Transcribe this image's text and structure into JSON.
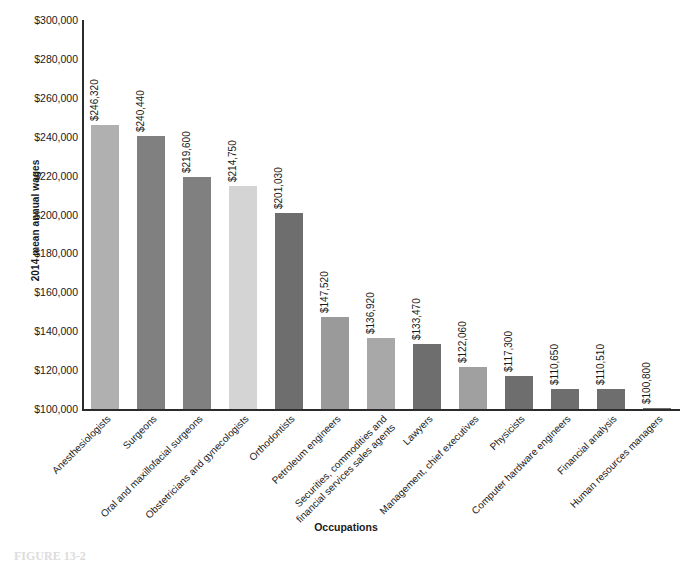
{
  "chart_data": {
    "type": "bar",
    "title": "",
    "xlabel": "Occupations",
    "ylabel": "2014 mean annual wages",
    "ylim": [
      100000,
      300000
    ],
    "ytick_step": 20000,
    "ytick_labels": [
      "$300,000",
      "$280,000",
      "$260,000",
      "$240,000",
      "$220,000",
      "$200,000",
      "$180,000",
      "$160,000",
      "$140,000",
      "$120,000",
      "$100,000"
    ],
    "ytick_values": [
      300000,
      280000,
      260000,
      240000,
      220000,
      200000,
      180000,
      160000,
      140000,
      120000,
      100000
    ],
    "grid": false,
    "legend": "none",
    "categories": [
      "Anesthesiologists",
      "Surgeons",
      "Oral and maxillofacial surgeons",
      "Obstetricians and gynecologists",
      "Orthodontists",
      "Petroleum engineers",
      "Securities, commodities and\nfinancial services sales agents",
      "Lawyers",
      "Management, chief executives",
      "Physicists",
      "Computer hardware engineers",
      "Financial analysis",
      "Human resources managers"
    ],
    "values": [
      246320,
      240440,
      219600,
      214750,
      201030,
      147520,
      136920,
      133470,
      122060,
      117300,
      110650,
      110510,
      100800
    ],
    "value_labels": [
      "$246,320",
      "$240,440",
      "$219,600",
      "$214,750",
      "$201,030",
      "$147,520",
      "$136,920",
      "$133,470",
      "$122,060",
      "$117,300",
      "$110,650",
      "$110,510",
      "$100,800"
    ],
    "bar_colors": [
      "#b0b0b0",
      "#808080",
      "#808080",
      "#d4d4d4",
      "#6e6e6e",
      "#9a9a9a",
      "#a8a8a8",
      "#6e6e6e",
      "#a0a0a0",
      "#6e6e6e",
      "#6e6e6e",
      "#6e6e6e",
      "#6e6e6e"
    ]
  },
  "axis": {
    "line_color": "#2b2b2b"
  },
  "caption": {
    "figure_label": "FIGURE 13-2"
  }
}
